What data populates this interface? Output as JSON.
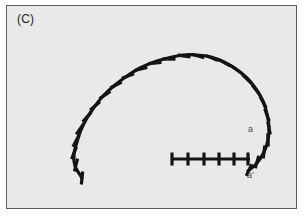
{
  "figure": {
    "panel_label": "(C)",
    "background_color": "#e8e8e8",
    "frame_color": "#5e5e5e",
    "ink_color": "#141414",
    "label_color": "#4a4a4a"
  },
  "annotations": {
    "arm_label": "a",
    "arm_prime_label": "a'"
  },
  "chart_data": {
    "type": "scatter",
    "title": "(C)",
    "subtitle": "",
    "xlabel": "",
    "ylabel": "",
    "grid": false,
    "legend": null,
    "xlim": [
      0,
      291
    ],
    "ylim": [
      0,
      204
    ],
    "annotations": [
      {
        "text": "(C)",
        "x": 10,
        "y": 12
      },
      {
        "text": "a",
        "x": 241,
        "y": 124
      },
      {
        "text": "a'",
        "x": 240,
        "y": 170
      }
    ],
    "series": [
      {
        "name": "arc-fiber",
        "kind": "arc-with-ticks",
        "stroke_width": 3.2,
        "tick_length": 13,
        "tick_width": 3.2,
        "tick_count": 27,
        "path_points": [
          [
            75,
            172
          ],
          [
            68,
            160
          ],
          [
            67,
            148
          ],
          [
            70,
            136
          ],
          [
            74,
            124
          ],
          [
            80,
            112
          ],
          [
            88,
            100
          ],
          [
            97,
            89
          ],
          [
            108,
            79
          ],
          [
            120,
            70
          ],
          [
            133,
            62
          ],
          [
            147,
            56
          ],
          [
            161,
            52
          ],
          [
            176,
            49
          ],
          [
            190,
            49
          ],
          [
            204,
            51
          ],
          [
            217,
            56
          ],
          [
            229,
            63
          ],
          [
            240,
            72
          ],
          [
            249,
            83
          ],
          [
            256,
            95
          ],
          [
            260,
            108
          ],
          [
            262,
            121
          ],
          [
            261,
            134
          ],
          [
            257,
            146
          ],
          [
            250,
            157
          ],
          [
            241,
            165
          ]
        ],
        "ticks": [
          {
            "x": 75,
            "y": 172,
            "angle": 96
          },
          {
            "x": 69,
            "y": 159,
            "angle": 104
          },
          {
            "x": 67,
            "y": 147,
            "angle": 112
          },
          {
            "x": 69,
            "y": 135,
            "angle": 118
          },
          {
            "x": 73,
            "y": 123,
            "angle": 125
          },
          {
            "x": 80,
            "y": 111,
            "angle": 132
          },
          {
            "x": 88,
            "y": 100,
            "angle": 139
          },
          {
            "x": 98,
            "y": 89,
            "angle": 146
          },
          {
            "x": 109,
            "y": 79,
            "angle": 153
          },
          {
            "x": 121,
            "y": 70,
            "angle": 160
          },
          {
            "x": 134,
            "y": 63,
            "angle": 167
          },
          {
            "x": 148,
            "y": 57,
            "angle": 174
          },
          {
            "x": 162,
            "y": 53,
            "angle": 181
          },
          {
            "x": 177,
            "y": 50,
            "angle": 188
          },
          {
            "x": 191,
            "y": 50,
            "angle": 195
          },
          {
            "x": 205,
            "y": 52,
            "angle": 202
          },
          {
            "x": 218,
            "y": 57,
            "angle": 209
          },
          {
            "x": 230,
            "y": 64,
            "angle": 216
          },
          {
            "x": 240,
            "y": 73,
            "angle": 224
          },
          {
            "x": 249,
            "y": 84,
            "angle": 232
          },
          {
            "x": 256,
            "y": 96,
            "angle": 241
          },
          {
            "x": 260,
            "y": 109,
            "angle": 250
          },
          {
            "x": 262,
            "y": 122,
            "angle": 259
          },
          {
            "x": 261,
            "y": 134,
            "angle": 268
          },
          {
            "x": 257,
            "y": 146,
            "angle": 277
          },
          {
            "x": 250,
            "y": 156,
            "angle": 286
          },
          {
            "x": 242,
            "y": 164,
            "angle": 295
          }
        ]
      },
      {
        "name": "straight-fiber",
        "kind": "line-with-ticks",
        "stroke_width": 3.2,
        "tick_length": 13,
        "tick_width": 3.2,
        "tick_count": 6,
        "x_start": 164,
        "x_end": 243,
        "y": 153,
        "ticks": [
          {
            "x": 165,
            "y": 153
          },
          {
            "x": 181,
            "y": 153
          },
          {
            "x": 197,
            "y": 153
          },
          {
            "x": 212,
            "y": 153
          },
          {
            "x": 227,
            "y": 153
          },
          {
            "x": 241,
            "y": 153
          }
        ]
      }
    ]
  }
}
